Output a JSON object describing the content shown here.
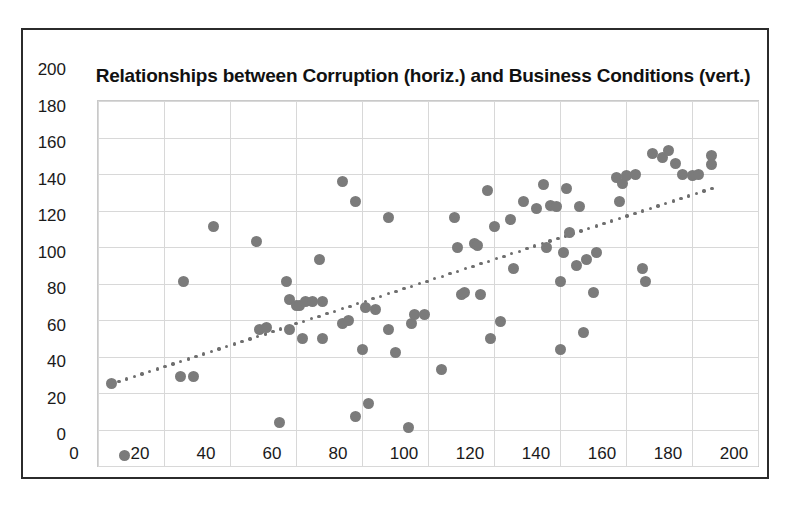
{
  "chart_data": {
    "type": "scatter",
    "title": "Relationships between Corruption (horiz.) and Business Conditions (vert.)",
    "xlabel": "",
    "ylabel": "",
    "xlim": [
      0,
      200
    ],
    "ylim": [
      0,
      200
    ],
    "x_ticks": [
      0,
      20,
      40,
      60,
      80,
      100,
      120,
      140,
      160,
      180,
      200
    ],
    "y_ticks": [
      0,
      20,
      40,
      60,
      80,
      100,
      120,
      140,
      160,
      180,
      200
    ],
    "grid": true,
    "legend": "none",
    "marker_color": "#7b7b7b",
    "trendline_color": "#6e6e6e",
    "trendline": {
      "style": "dotted",
      "x_start": 4,
      "y_start": 45,
      "x_end": 186,
      "y_end": 152
    },
    "points": [
      [
        4,
        45
      ],
      [
        8,
        6
      ],
      [
        25,
        49
      ],
      [
        26,
        101
      ],
      [
        29,
        49
      ],
      [
        35,
        131
      ],
      [
        48,
        123
      ],
      [
        49,
        75
      ],
      [
        51,
        76
      ],
      [
        55,
        24
      ],
      [
        57,
        101
      ],
      [
        58,
        91
      ],
      [
        58,
        75
      ],
      [
        60,
        88
      ],
      [
        61,
        88
      ],
      [
        62,
        70
      ],
      [
        63,
        90
      ],
      [
        65,
        90
      ],
      [
        67,
        113
      ],
      [
        68,
        90
      ],
      [
        68,
        70
      ],
      [
        74,
        156
      ],
      [
        74,
        78
      ],
      [
        76,
        80
      ],
      [
        78,
        145
      ],
      [
        78,
        27
      ],
      [
        80,
        64
      ],
      [
        81,
        87
      ],
      [
        82,
        34
      ],
      [
        84,
        86
      ],
      [
        88,
        136
      ],
      [
        88,
        75
      ],
      [
        90,
        62
      ],
      [
        94,
        21
      ],
      [
        95,
        78
      ],
      [
        96,
        83
      ],
      [
        99,
        83
      ],
      [
        104,
        53
      ],
      [
        108,
        136
      ],
      [
        109,
        120
      ],
      [
        110,
        94
      ],
      [
        111,
        95
      ],
      [
        114,
        122
      ],
      [
        115,
        121
      ],
      [
        116,
        94
      ],
      [
        118,
        151
      ],
      [
        119,
        70
      ],
      [
        120,
        131
      ],
      [
        122,
        79
      ],
      [
        125,
        135
      ],
      [
        126,
        108
      ],
      [
        129,
        145
      ],
      [
        133,
        141
      ],
      [
        135,
        154
      ],
      [
        136,
        120
      ],
      [
        137,
        143
      ],
      [
        139,
        142
      ],
      [
        140,
        101
      ],
      [
        140,
        64
      ],
      [
        141,
        117
      ],
      [
        142,
        152
      ],
      [
        143,
        128
      ],
      [
        145,
        110
      ],
      [
        146,
        142
      ],
      [
        147,
        73
      ],
      [
        148,
        113
      ],
      [
        150,
        95
      ],
      [
        151,
        117
      ],
      [
        157,
        158
      ],
      [
        158,
        145
      ],
      [
        159,
        155
      ],
      [
        160,
        159
      ],
      [
        163,
        160
      ],
      [
        165,
        108
      ],
      [
        166,
        101
      ],
      [
        168,
        171
      ],
      [
        171,
        169
      ],
      [
        173,
        173
      ],
      [
        175,
        166
      ],
      [
        177,
        160
      ],
      [
        180,
        159
      ],
      [
        182,
        160
      ],
      [
        186,
        170
      ],
      [
        186,
        165
      ]
    ]
  }
}
